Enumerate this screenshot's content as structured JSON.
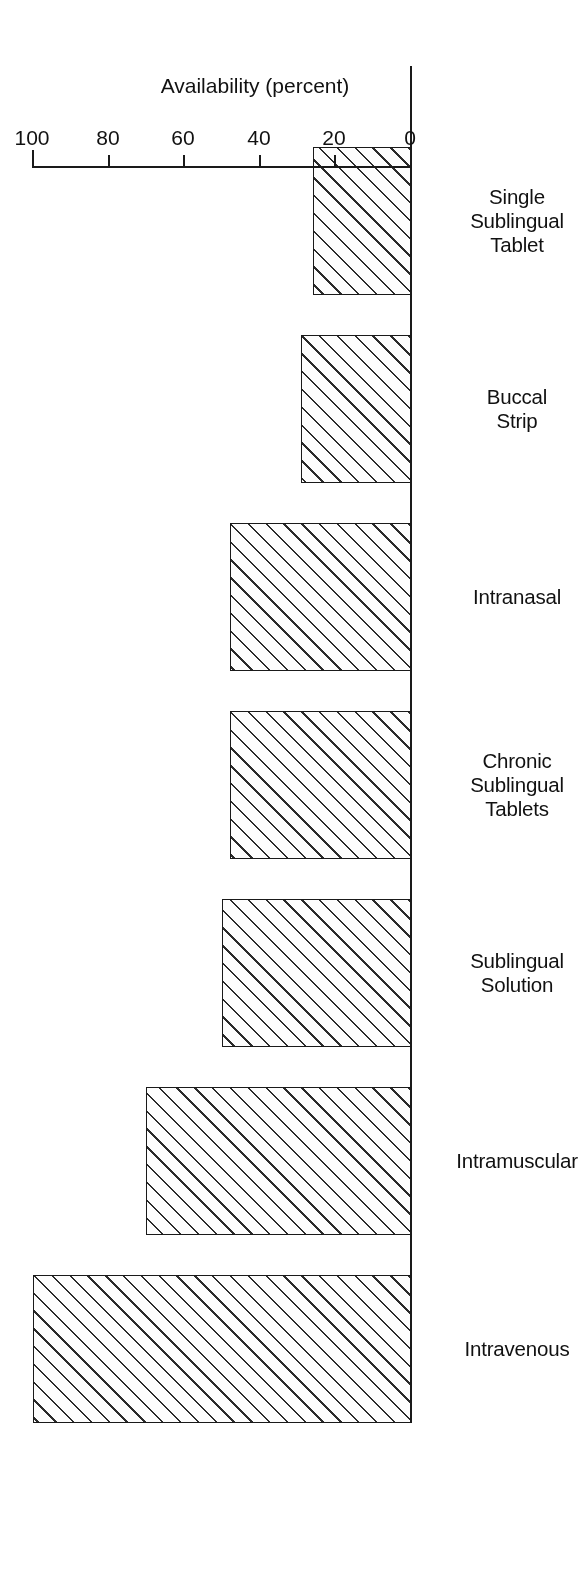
{
  "chart_data": {
    "type": "bar",
    "orientation": "horizontal",
    "title": "",
    "subtitle": "",
    "xlabel": "",
    "ylabel": "Availability (percent)",
    "categories": [
      "Intravenous",
      "Intramuscular",
      "Sublingual\nSolution",
      "Chronic\nSublingual\nTablets",
      "Intranasal",
      "Buccal\nStrip",
      "Single\nSublingual\nTablet"
    ],
    "values": [
      100,
      70,
      50,
      48,
      48,
      29,
      26
    ],
    "value_axis_ticks": [
      0,
      20,
      40,
      60,
      80,
      100
    ],
    "value_axis_tick_labels": [
      "0",
      "20",
      "40",
      "60",
      "80",
      "100"
    ],
    "ylim": [
      0,
      100
    ],
    "grid": false,
    "legend": null,
    "bar_style": {
      "fill": "diagonal-hatch",
      "hatch_color": "#2b2b2b",
      "face_color": "#fdfdfd",
      "edge_color": "#1a1a1a"
    },
    "series": [
      {
        "name": "Availability (percent)",
        "values": [
          100,
          70,
          50,
          48,
          48,
          29,
          26
        ]
      }
    ],
    "points": [
      {
        "category": "Intravenous",
        "value": 100
      },
      {
        "category": "Intramuscular",
        "value": 70
      },
      {
        "category": "Sublingual Solution",
        "value": 50
      },
      {
        "category": "Chronic Sublingual Tablets",
        "value": 48
      },
      {
        "category": "Intranasal",
        "value": 48
      },
      {
        "category": "Buccal Strip",
        "value": 29
      },
      {
        "category": "Single Sublingual Tablet",
        "value": 26
      }
    ]
  },
  "figure": {
    "background_color": "#ffffff",
    "foreground_color": "#1a1a1a",
    "rotation_degrees": 180
  }
}
